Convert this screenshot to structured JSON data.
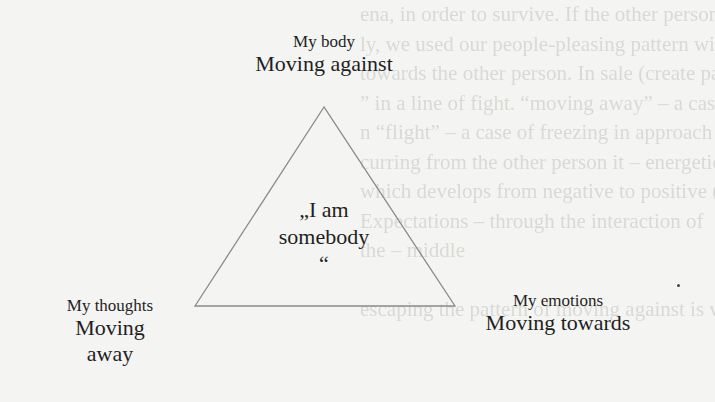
{
  "diagram": {
    "type": "triangle",
    "center": {
      "line1": "„I am",
      "line2": "somebody",
      "line3": "“"
    },
    "vertices": {
      "top": {
        "label": "My body",
        "movement": "Moving against"
      },
      "bottom_left": {
        "label": "My thoughts",
        "movement_line1": "Moving",
        "movement_line2": "away"
      },
      "bottom_right": {
        "label": "My emotions",
        "movement": "Moving towards"
      }
    },
    "geometry": {
      "apex": [
        324,
        107
      ],
      "bottom_left": [
        195,
        306
      ],
      "bottom_right": [
        455,
        306
      ],
      "stroke": "#8a8a8a"
    }
  },
  "background_bleed_through": [
    "ena, in order to survive. If the other person is concerned",
    "ly, we used our people-pleasing pattern with o",
    "towards the other person. In sale (create pattern “in",
    "” in a line of fight. “moving away” – a case of shield",
    "n “flight” – a case of freezing in approach somebody",
    "curring from the other person it – energetic reaction",
    "which develops from negative to positive (Peter – author 20",
    "Expectations – through the interaction of",
    "the – middle",
    "",
    "escaping the pattern of moving against is within the em"
  ]
}
